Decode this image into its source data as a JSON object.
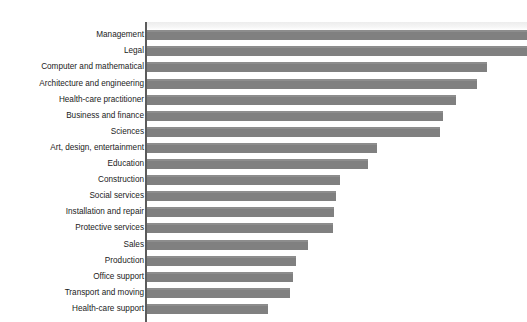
{
  "figure": {
    "top_artifact_text": "· · ·  ·  ·   ·",
    "axis_color": "#5c5c5c",
    "bar_color": "#808080",
    "background_color": "#ffffff"
  },
  "chart_data": {
    "type": "bar",
    "orientation": "horizontal",
    "title": "",
    "subtitle": "",
    "xlabel": "",
    "ylabel": "",
    "grid": false,
    "legend": null,
    "xlim": [
      0,
      100
    ],
    "note": "Values are percentages estimated from bar lengths; the two longest bars run to the cropped right edge of the image.",
    "categories": [
      "Management",
      "Legal",
      "Computer and mathematical",
      "Architecture and engineering",
      "Health-care practitioner",
      "Business and finance",
      "Sciences",
      "Art, design, entertainment",
      "Education",
      "Construction",
      "Social services",
      "Installation and repair",
      "Protective services",
      "Sales",
      "Production",
      "Office support",
      "Transport and moving",
      "Health-care support"
    ],
    "values": [
      100,
      100,
      89,
      87,
      81,
      78,
      77,
      60,
      58,
      51,
      50,
      49,
      49,
      42,
      39,
      38,
      38,
      32
    ],
    "bar_end_px": [
      527,
      527,
      487,
      477,
      456,
      443,
      440,
      377,
      368,
      340,
      336,
      334,
      333,
      308,
      296,
      293,
      290,
      268
    ],
    "axis_origin_px": 147
  }
}
